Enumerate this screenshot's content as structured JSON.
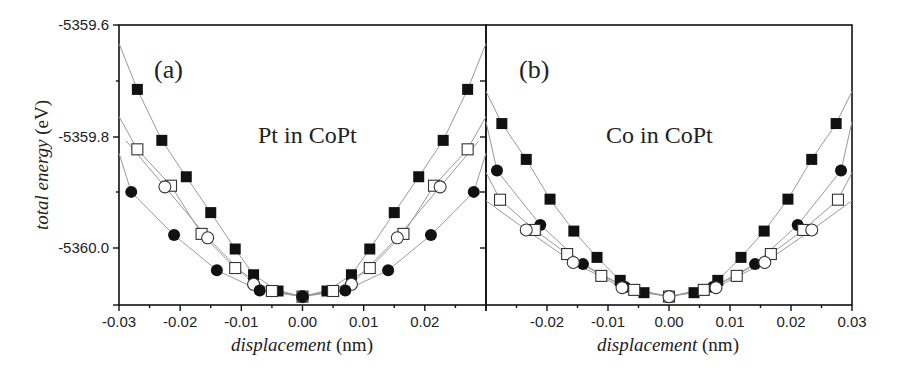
{
  "chart_data": [
    {
      "type": "scatter",
      "panel": "(a)",
      "annotation": "Pt in CoPt",
      "xlabel_italic": "displacement",
      "xlabel_unit": "(nm)",
      "ylabel_italic": "total energy",
      "ylabel_unit": "(eV)",
      "xlim": [
        -0.03,
        0.03
      ],
      "ylim": [
        -5360.1,
        -5359.6
      ],
      "xticks": [
        "-0.03",
        "-0.02",
        "-0.01",
        "0.00",
        "0.01",
        "0.02"
      ],
      "yticks": [
        "-5359.6",
        "-5359.8",
        "-5360.0"
      ],
      "series": [
        {
          "name": "filled-square",
          "marker": "square-filled",
          "x": [
            -0.027,
            -0.023,
            -0.019,
            -0.015,
            -0.011,
            -0.008,
            -0.004,
            0.0,
            0.004,
            0.008,
            0.011,
            0.015,
            0.019,
            0.023,
            0.027
          ],
          "y": [
            -5359.715,
            -5359.806,
            -5359.871,
            -5359.935,
            -5360.0,
            -5360.046,
            -5360.075,
            -5360.085,
            -5360.075,
            -5360.046,
            -5360.0,
            -5359.935,
            -5359.871,
            -5359.806,
            -5359.715
          ]
        },
        {
          "name": "open-square",
          "marker": "square-open",
          "x": [
            -0.027,
            -0.0215,
            -0.0165,
            -0.011,
            -0.005,
            0.0,
            0.005,
            0.011,
            0.0165,
            0.0215,
            0.027
          ],
          "y": [
            -5359.822,
            -5359.887,
            -5359.973,
            -5360.034,
            -5360.075,
            -5360.085,
            -5360.075,
            -5360.034,
            -5359.973,
            -5359.887,
            -5359.822
          ]
        },
        {
          "name": "open-circle",
          "marker": "circle-open",
          "x": [
            -0.0225,
            -0.0155,
            -0.008,
            0.0,
            0.008,
            0.0155,
            0.0225
          ],
          "y": [
            -5359.889,
            -5359.98,
            -5360.063,
            -5360.085,
            -5360.063,
            -5359.98,
            -5359.889
          ]
        },
        {
          "name": "filled-circle",
          "marker": "circle-filled",
          "x": [
            -0.028,
            -0.021,
            -0.014,
            -0.007,
            0.0,
            0.007,
            0.014,
            0.021,
            0.028
          ],
          "y": [
            -5359.898,
            -5359.975,
            -5360.038,
            -5360.074,
            -5360.085,
            -5360.074,
            -5360.038,
            -5359.975,
            -5359.898
          ]
        }
      ]
    },
    {
      "type": "scatter",
      "panel": "(b)",
      "annotation": "Co in CoPt",
      "xlabel_italic": "displacement",
      "xlabel_unit": "(nm)",
      "xlim": [
        -0.03,
        0.03
      ],
      "ylim": [
        -5360.1,
        -5359.6
      ],
      "xticks": [
        "-0.02",
        "-0.01",
        "0.00",
        "0.01",
        "0.02",
        "0.03"
      ],
      "series": [
        {
          "name": "filled-square",
          "marker": "square-filled",
          "x": [
            -0.0274,
            -0.0234,
            -0.0195,
            -0.0156,
            -0.0118,
            -0.008,
            -0.0041,
            0.0,
            0.0041,
            0.008,
            0.0118,
            0.0156,
            0.0195,
            0.0234,
            0.0274
          ],
          "y": [
            -5359.776,
            -5359.84,
            -5359.911,
            -5359.968,
            -5360.015,
            -5360.056,
            -5360.078,
            -5360.085,
            -5360.078,
            -5360.056,
            -5360.015,
            -5359.968,
            -5359.911,
            -5359.84,
            -5359.776
          ]
        },
        {
          "name": "filled-circle",
          "marker": "circle-filled",
          "x": [
            -0.0282,
            -0.0211,
            -0.0141,
            -0.0072,
            0.0,
            0.0072,
            0.0141,
            0.0211,
            0.0282
          ],
          "y": [
            -5359.86,
            -5359.957,
            -5360.027,
            -5360.068,
            -5360.085,
            -5360.068,
            -5360.027,
            -5359.957,
            -5359.86
          ]
        },
        {
          "name": "open-square",
          "marker": "square-open",
          "x": [
            -0.0277,
            -0.022,
            -0.0167,
            -0.0111,
            -0.0057,
            0.0,
            0.0057,
            0.0111,
            0.0167,
            0.022,
            0.0277
          ],
          "y": [
            -5359.912,
            -5359.966,
            -5360.009,
            -5360.048,
            -5360.073,
            -5360.085,
            -5360.073,
            -5360.048,
            -5360.009,
            -5359.966,
            -5359.912
          ]
        },
        {
          "name": "open-circle",
          "marker": "circle-open",
          "x": [
            -0.0234,
            -0.0157,
            -0.0077,
            0.0,
            0.0077,
            0.0157,
            0.0234
          ],
          "y": [
            -5359.966,
            -5360.024,
            -5360.069,
            -5360.085,
            -5360.069,
            -5360.024,
            -5359.966
          ]
        }
      ]
    }
  ],
  "figure": {
    "panel_a_tag": "(a)",
    "panel_b_tag": "(b)",
    "panel_a_annotation": "Pt in CoPt",
    "panel_b_annotation": "Co in CoPt",
    "ylabel_italic": "total energy",
    "ylabel_unit": " (eV)",
    "xlabel_italic": "displacement",
    "xlabel_unit": " (nm)",
    "yticks": [
      "-5359.6",
      "-5359.8",
      "-5360.0"
    ],
    "xticks_a": [
      "-0.03",
      "-0.02",
      "-0.01",
      "0.00",
      "0.01",
      "0.02"
    ],
    "xticks_b": [
      "-0.02",
      "-0.01",
      "0.00",
      "0.01",
      "0.02",
      "0.03"
    ]
  }
}
